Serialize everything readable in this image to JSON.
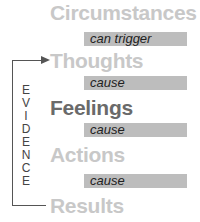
{
  "diagram": {
    "nodes": [
      {
        "label": "Circumstances",
        "emphasis": "light"
      },
      {
        "label": "Thoughts",
        "emphasis": "light"
      },
      {
        "label": "Feelings",
        "emphasis": "dark"
      },
      {
        "label": "Actions",
        "emphasis": "light"
      },
      {
        "label": "Results",
        "emphasis": "light"
      }
    ],
    "connectors": [
      {
        "label": "can trigger"
      },
      {
        "label": "cause"
      },
      {
        "label": "cause"
      },
      {
        "label": "cause"
      }
    ],
    "feedback_loop": {
      "label_letters": [
        "E",
        "V",
        "I",
        "D",
        "E",
        "N",
        "C",
        "E"
      ],
      "from": "Results",
      "to": "Thoughts"
    }
  },
  "colors": {
    "light_text": "#c8c8c8",
    "dark_text": "#6a6a6a",
    "bar": "#bdbdbd",
    "line": "#555555"
  }
}
